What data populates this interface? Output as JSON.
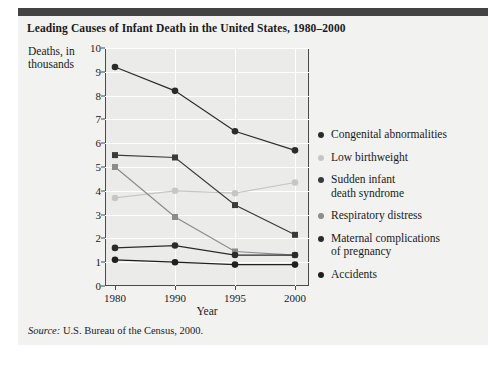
{
  "figure": {
    "title": "Leading Causes of Infant Death in the United States, 1980–2000",
    "source_prefix": "Source:",
    "source_text": " U.S. Bureau of the Census, 2000."
  },
  "colors": {
    "card_background": "#f2f2f1",
    "plot_background": "#ebebea",
    "top_bar": "#434343",
    "axis": "#4a4a4a",
    "gridline": "#ffffff",
    "text": "#1a1a1a",
    "series_dark": "#2b2b2b",
    "series_light": "#c6c6c6",
    "series_mid": "#3a3a3a",
    "series_gray": "#8c8c8c"
  },
  "chart_data": {
    "type": "line",
    "title": "Leading Causes of Infant Death in the United States, 1980–2000",
    "xlabel": "Year",
    "ylabel": "Deaths, in thousands",
    "categories": [
      "1980",
      "1990",
      "1995",
      "2000"
    ],
    "xticks": [
      "1980",
      "1990",
      "1995",
      "2000"
    ],
    "yticks": [
      "0",
      "1",
      "2",
      "3",
      "4",
      "5",
      "6",
      "7",
      "8",
      "9",
      "10"
    ],
    "ylim": [
      0,
      10
    ],
    "grid": true,
    "legend_position": "right",
    "series": [
      {
        "name": "Congenital abnormalities",
        "color": "#2b2b2b",
        "marker": "circle",
        "values": [
          9.2,
          8.2,
          6.5,
          5.7
        ]
      },
      {
        "name": "Low birthweight",
        "color": "#c6c6c6",
        "marker": "circle",
        "values": [
          3.7,
          4.0,
          3.9,
          4.35
        ]
      },
      {
        "name": "Sudden infant\ndeath syndrome",
        "color": "#3a3a3a",
        "marker": "square",
        "values": [
          5.5,
          5.4,
          3.4,
          2.15
        ]
      },
      {
        "name": "Respiratory distress",
        "color": "#8c8c8c",
        "marker": "square",
        "values": [
          5.0,
          2.9,
          1.45,
          1.3
        ]
      },
      {
        "name": "Maternal complications\nof pregnancy",
        "color": "#2b2b2b",
        "marker": "circle",
        "values": [
          1.6,
          1.7,
          1.3,
          1.3
        ]
      },
      {
        "name": "Accidents",
        "color": "#1f1f1f",
        "marker": "circle",
        "values": [
          1.1,
          1.0,
          0.9,
          0.9
        ]
      }
    ]
  },
  "legend": {
    "items": [
      {
        "label": "Congenital abnormalities",
        "color": "#2b2b2b"
      },
      {
        "label": "Low birthweight",
        "color": "#c6c6c6"
      },
      {
        "label": "Sudden infant\ndeath syndrome",
        "color": "#3a3a3a"
      },
      {
        "label": "Respiratory distress",
        "color": "#8c8c8c"
      },
      {
        "label": "Maternal complications\nof pregnancy",
        "color": "#2b2b2b"
      },
      {
        "label": "Accidents",
        "color": "#1f1f1f"
      }
    ]
  }
}
